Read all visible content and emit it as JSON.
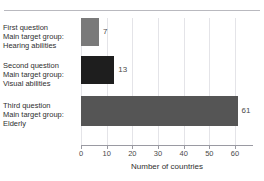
{
  "chart_data": {
    "type": "bar",
    "orientation": "horizontal",
    "title": "",
    "xlabel": "Number of countries",
    "ylabel": "",
    "xlim": [
      0,
      67
    ],
    "xticks": [
      0,
      10,
      20,
      30,
      40,
      50,
      60
    ],
    "xticklabels": [
      "0",
      "10",
      "20",
      "30",
      "40",
      "50",
      "60"
    ],
    "grid": true,
    "grid_axis": "x",
    "legend": false,
    "categories": [
      "First question\nMain target group:\nHearing abilities",
      "Second question\nMain target group:\nVisual abilities",
      "Third question\nMain target group:\nElderly"
    ],
    "values": [
      7,
      13,
      61
    ],
    "value_labels": [
      "7",
      "13",
      "61"
    ],
    "bar_colors": [
      "#7a7a7a",
      "#1e1e1e",
      "#555555"
    ]
  },
  "chart": {
    "axis_title": "Number of countries",
    "ticks": [
      {
        "value": 0,
        "label": "0"
      },
      {
        "value": 10,
        "label": "10"
      },
      {
        "value": 20,
        "label": "20"
      },
      {
        "value": 30,
        "label": "30"
      },
      {
        "value": 40,
        "label": "40"
      },
      {
        "value": 50,
        "label": "50"
      },
      {
        "value": 60,
        "label": "60"
      }
    ],
    "bars": [
      {
        "line1": "First question",
        "line2": "Main target group:",
        "line3": "Hearing abilities",
        "value": 7,
        "value_label": "7",
        "color": "#7a7a7a"
      },
      {
        "line1": "Second question",
        "line2": "Main target group:",
        "line3": "Visual abilities",
        "value": 13,
        "value_label": "13",
        "color": "#1e1e1e"
      },
      {
        "line1": "Third question",
        "line2": "Main target group:",
        "line3": "Elderly",
        "value": 61,
        "value_label": "61",
        "color": "#555555"
      }
    ]
  }
}
